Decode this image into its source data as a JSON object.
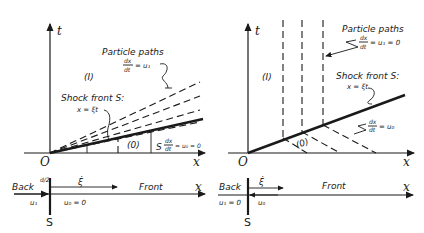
{
  "left_panel": {
    "axis_t": "t",
    "axis_x": "x",
    "origin": "O",
    "region_behind": "(I)",
    "region_ahead": "(0)",
    "particle_paths_title": "Particle paths",
    "particle_paths_eq": "dx/dt = u₁",
    "particle_paths_num": "dx",
    "particle_paths_den": "dt",
    "particle_paths_rhs": "= u₁",
    "shock_title": "Shock front S:",
    "shock_eq": "x = ξt",
    "front_region_label": "S",
    "front_eq_num": "dx",
    "front_eq_den": "dt",
    "front_eq_rhs": "= u₀ = 0",
    "lab_strip": {
      "back": "Back",
      "front": "Front",
      "axis_x": "x",
      "shock_label": "S",
      "shock_speed": "ξ̇",
      "u_back": "u₁",
      "u_front": "u₀ = 0",
      "small_mark": "d/2"
    }
  },
  "right_panel": {
    "axis_t": "t",
    "axis_x": "x",
    "origin": "O",
    "region_behind": "(I)",
    "region_ahead": "(0)",
    "particle_paths_title": "Particle paths",
    "particle_paths_num": "dx",
    "particle_paths_den": "dt",
    "particle_paths_rhs": "= u₁ = 0",
    "shock_title": "Shock front S:",
    "shock_eq": "x = ξt",
    "front_eq_num": "dx",
    "front_eq_den": "dt",
    "front_eq_rhs": "= u₀",
    "lab_strip": {
      "back": "Back",
      "front": "Front",
      "axis_x": "x",
      "shock_label": "S",
      "shock_speed": "ξ̇",
      "u_back": "u₁ = 0",
      "u_front": "u₀"
    }
  }
}
